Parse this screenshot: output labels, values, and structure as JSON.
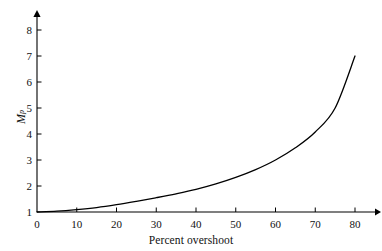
{
  "chart_data": {
    "type": "line",
    "title": "",
    "xlabel": "Percent overshoot",
    "ylabel": "Mp",
    "ylabel_base": "M",
    "ylabel_sub": "p",
    "xlim": [
      0,
      80
    ],
    "ylim": [
      1,
      8
    ],
    "xticks": [
      0,
      10,
      20,
      30,
      40,
      50,
      60,
      70,
      80
    ],
    "xtick_labels": [
      "0",
      "10",
      "20",
      "30",
      "40",
      "50",
      "60",
      "70",
      "80"
    ],
    "yticks": [
      1,
      2,
      3,
      4,
      5,
      6,
      7,
      8
    ],
    "ytick_labels": [
      "1",
      "2",
      "3",
      "4",
      "5",
      "6",
      "7",
      "8"
    ],
    "grid": false,
    "legend": null,
    "axis_arrows": true,
    "tick_direction": "inward",
    "line_color": "#000000",
    "line_width": 1.3,
    "background": "#ffffff",
    "series": [
      {
        "name": "Resonant peak vs percent overshoot",
        "x": [
          0,
          5,
          10,
          15,
          20,
          25,
          30,
          35,
          40,
          45,
          50,
          55,
          60,
          65,
          70,
          75,
          80
        ],
        "y": [
          1.0,
          1.03,
          1.09,
          1.17,
          1.28,
          1.41,
          1.55,
          1.7,
          1.87,
          2.08,
          2.33,
          2.63,
          3.0,
          3.47,
          4.08,
          5.0,
          7.0
        ]
      }
    ],
    "endpoint": {
      "x": 80,
      "y": 7.0
    },
    "start_point": {
      "x": 0,
      "y": 1.0
    }
  },
  "figure": {
    "x_axis_title": "Percent overshoot"
  }
}
